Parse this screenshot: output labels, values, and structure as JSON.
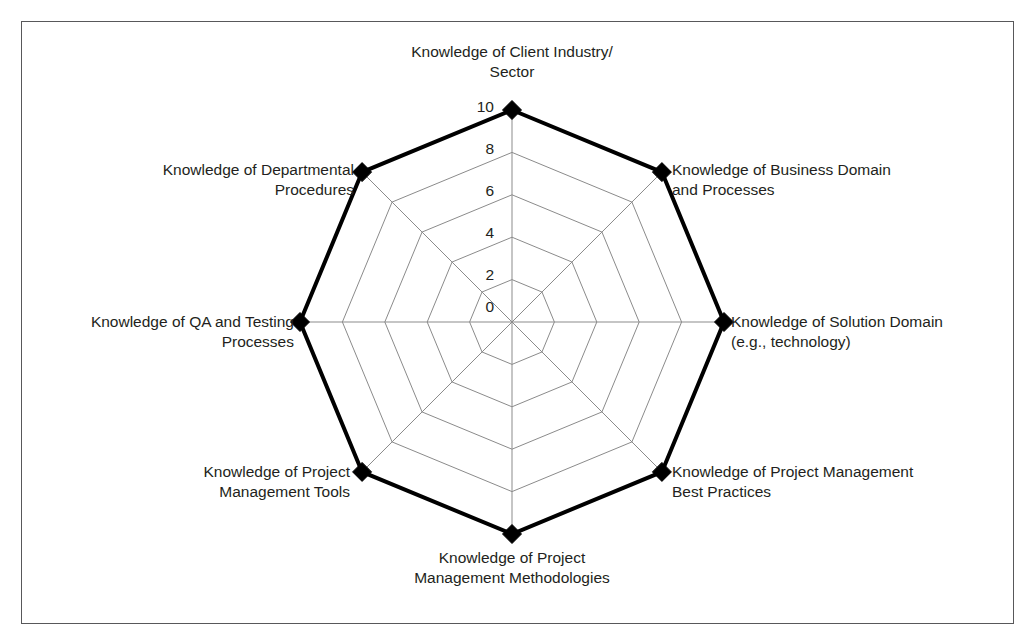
{
  "figure": {
    "background_color": "#ffffff",
    "frame_color": "#58585a"
  },
  "chart_data": {
    "type": "radar",
    "title": "",
    "subtitle": "",
    "xlabel": "",
    "ylabel": "",
    "grid": true,
    "legend_position": "none",
    "rlim": [
      0,
      10
    ],
    "r_ticks": [
      "0",
      "2",
      "4",
      "6",
      "8",
      "10"
    ],
    "r_tick_values": [
      0,
      2,
      4,
      6,
      8,
      10
    ],
    "grid_rings": [
      2,
      4,
      6,
      8,
      10
    ],
    "start_angle_deg": 90,
    "direction": "clockwise",
    "categories": [
      "Knowledge of Client Industry/\nSector",
      "Knowledge of Business Domain\nand Processes",
      "Knowledge of Solution Domain\n(e.g., technology)",
      "Knowledge of Project Management\nBest Practices",
      "Knowledge of Project\nManagement Methodologies",
      "Knowledge of Project\nManagement Tools",
      "Knowledge of QA and Testing\nProcesses",
      "Knowledge of Departmental\nProcedures"
    ],
    "series": [
      {
        "name": "Knowledge areas",
        "values": [
          10,
          10,
          10,
          10,
          10,
          10,
          10,
          10
        ],
        "line_color": "#000000",
        "line_width": 4,
        "marker": "diamond",
        "marker_color": "#000000",
        "fill": "none"
      }
    ],
    "grid_color": "#8b8b8b",
    "grid_width": 1
  },
  "axis_labels": [
    {
      "name": "axis-label-client-industry",
      "text": "Knowledge of Client Industry/\nSector"
    },
    {
      "name": "axis-label-business-domain",
      "text": "Knowledge of Business Domain\nand Processes"
    },
    {
      "name": "axis-label-solution-domain",
      "text": "Knowledge of Solution Domain\n(e.g., technology)"
    },
    {
      "name": "axis-label-pm-best-practices",
      "text": "Knowledge of Project Management\nBest Practices"
    },
    {
      "name": "axis-label-pm-methodologies",
      "text": "Knowledge of Project\nManagement Methodologies"
    },
    {
      "name": "axis-label-pm-tools",
      "text": "Knowledge of Project\nManagement Tools"
    },
    {
      "name": "axis-label-qa-testing",
      "text": "Knowledge of QA and Testing\nProcesses"
    },
    {
      "name": "axis-label-departmental-procedures",
      "text": "Knowledge of Departmental\nProcedures"
    }
  ],
  "radial_ticks": [
    {
      "name": "radial-tick-10",
      "text": "10"
    },
    {
      "name": "radial-tick-8",
      "text": "8"
    },
    {
      "name": "radial-tick-6",
      "text": "6"
    },
    {
      "name": "radial-tick-4",
      "text": "4"
    },
    {
      "name": "radial-tick-2",
      "text": "2"
    },
    {
      "name": "radial-tick-0",
      "text": "0"
    }
  ]
}
